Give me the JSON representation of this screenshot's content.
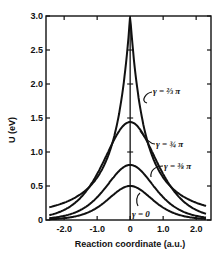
{
  "chart_data": {
    "type": "line",
    "title": "",
    "xlabel": "Reaction coordinate (a.u.)",
    "ylabel": "U (eV)",
    "xlim": [
      -2.55,
      2.45
    ],
    "ylim": [
      0,
      3.0
    ],
    "xticks": [
      -2.0,
      -1.0,
      0,
      1.0,
      2.0
    ],
    "xtick_labels": [
      "-2.0",
      "-1.0",
      "0",
      "1.0",
      "2.0"
    ],
    "yticks": [
      0,
      0.5,
      1.0,
      1.5,
      2.0,
      2.5,
      3.0
    ],
    "ytick_labels": [
      "0",
      "0.5",
      "1.0",
      "1.5",
      "2.0",
      "2.5",
      "3.0"
    ],
    "grid": false,
    "legend": "none (curves labeled inline)",
    "center_line": {
      "x": 0,
      "ticks_at_y": [
        0.5,
        1.0,
        1.5,
        2.0,
        2.5
      ]
    },
    "x": [
      -2.5,
      -2.0,
      -1.5,
      -1.0,
      -0.5,
      -0.25,
      0,
      0.25,
      0.5,
      1.0,
      1.5,
      2.0,
      2.3
    ],
    "series": [
      {
        "name": "γ = 2/3 π",
        "label": "γ = ⅔ π",
        "peak": 3.0,
        "values": [
          0.15,
          0.28,
          0.47,
          0.8,
          1.45,
          2.1,
          3.0,
          2.1,
          1.45,
          0.8,
          0.47,
          0.28,
          0.2
        ]
      },
      {
        "name": "γ = 3/4 π",
        "label": "γ = ¾ π",
        "peak": 1.44,
        "values": [
          0.08,
          0.17,
          0.33,
          0.65,
          1.15,
          1.36,
          1.44,
          1.36,
          1.15,
          0.65,
          0.33,
          0.17,
          0.12
        ]
      },
      {
        "name": "γ = 3/8 π",
        "label": "γ = ⅜ π",
        "peak": 0.81,
        "values": [
          0.05,
          0.11,
          0.22,
          0.42,
          0.67,
          0.77,
          0.81,
          0.77,
          0.67,
          0.42,
          0.22,
          0.11,
          0.08
        ]
      },
      {
        "name": "γ = 0",
        "label": "γ = 0",
        "peak": 0.5,
        "values": [
          0.02,
          0.05,
          0.11,
          0.22,
          0.39,
          0.47,
          0.5,
          0.47,
          0.39,
          0.22,
          0.11,
          0.05,
          0.03
        ]
      }
    ]
  },
  "annotations": {
    "g23": "γ = ⅔ π",
    "g34": "γ = ¾ π",
    "g38": "γ = ⅜ π",
    "g0": "γ = 0"
  },
  "colors": {
    "line": "#111111",
    "background": "#ffffff"
  }
}
